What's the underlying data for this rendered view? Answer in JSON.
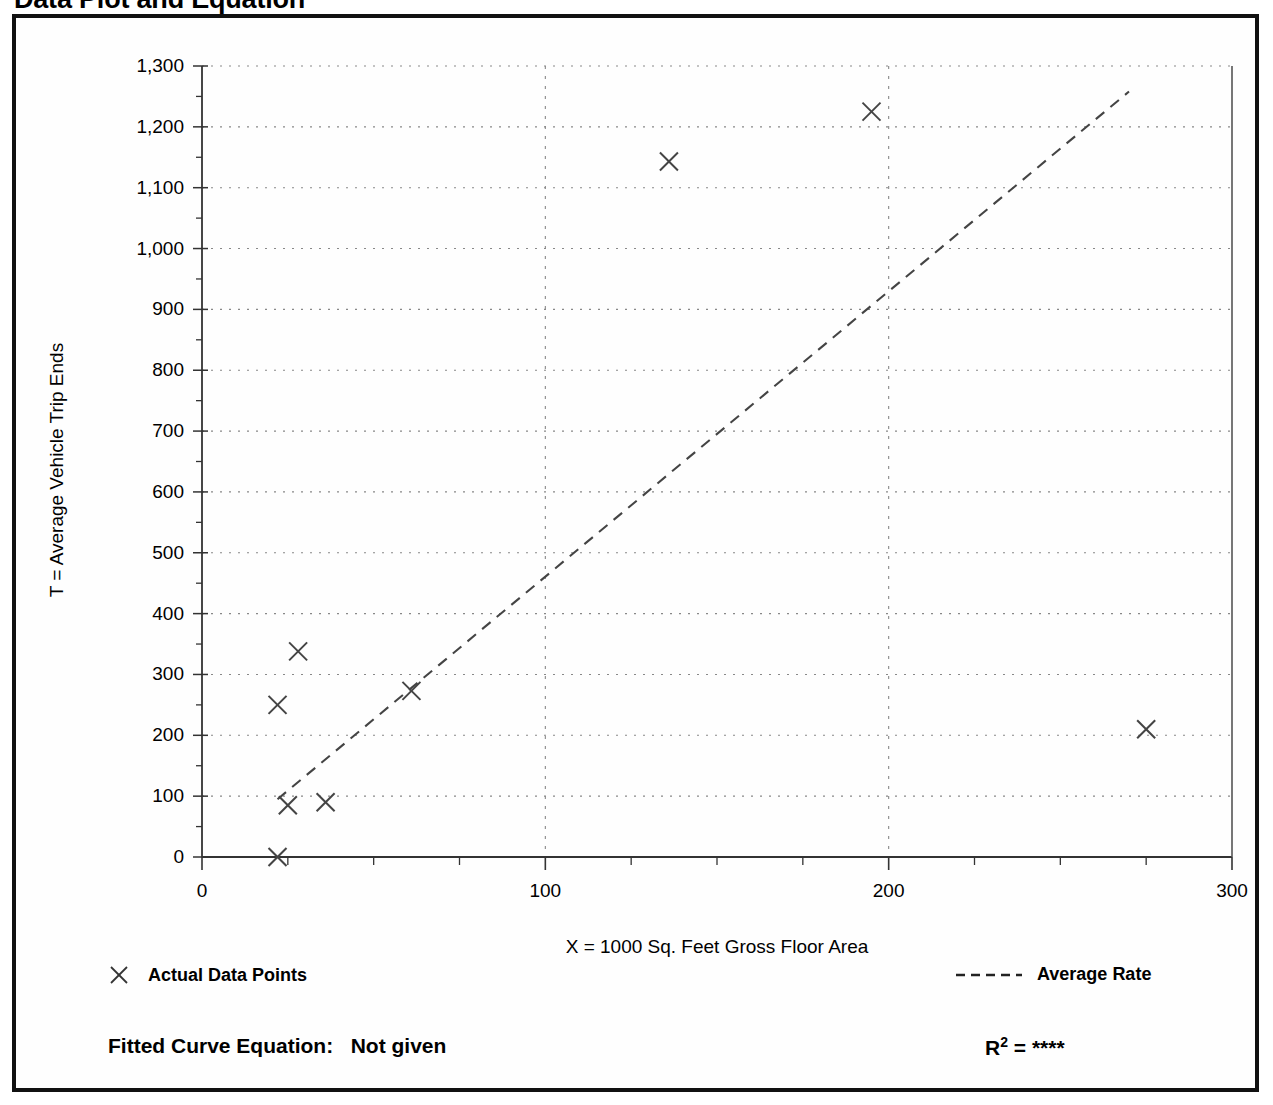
{
  "page": {
    "title": "Data Plot and Equation"
  },
  "chart_data": {
    "type": "scatter",
    "title": "Data Plot and Equation",
    "xlabel": "X = 1000 Sq. Feet Gross Floor Area",
    "ylabel": "T = Average Vehicle Trip Ends",
    "xlim": [
      0,
      300
    ],
    "ylim": [
      0,
      1300
    ],
    "x_ticks": [
      0,
      100,
      200,
      300
    ],
    "x_tick_labels": [
      "0",
      "100",
      "200",
      "300"
    ],
    "x_minor_tick_step": 25,
    "y_ticks": [
      0,
      100,
      200,
      300,
      400,
      500,
      600,
      700,
      800,
      900,
      1000,
      1100,
      1200,
      1300
    ],
    "y_tick_labels": [
      "0",
      "100",
      "200",
      "300",
      "400",
      "500",
      "600",
      "700",
      "800",
      "900",
      "1,000",
      "1,100",
      "1,200",
      "1,300"
    ],
    "grid": {
      "horizontal": true,
      "vertical": true,
      "vertical_at": [
        100,
        200
      ],
      "style": "dotted",
      "color": "#888888"
    },
    "series": [
      {
        "name": "Actual Data Points",
        "type": "scatter",
        "marker": "x",
        "color": "#444444",
        "points": [
          {
            "x": 22,
            "y": 0
          },
          {
            "x": 22,
            "y": 250
          },
          {
            "x": 25,
            "y": 85
          },
          {
            "x": 28,
            "y": 338
          },
          {
            "x": 36,
            "y": 90
          },
          {
            "x": 61,
            "y": 273
          },
          {
            "x": 136,
            "y": 1143
          },
          {
            "x": 195,
            "y": 1225
          },
          {
            "x": 275,
            "y": 210
          }
        ]
      },
      {
        "name": "Average Rate",
        "type": "line",
        "style": "dashed",
        "color": "#444444",
        "points": [
          {
            "x": 22,
            "y": 95
          },
          {
            "x": 270,
            "y": 1258
          }
        ]
      }
    ]
  },
  "legend": {
    "position": "below-axis",
    "entries": [
      {
        "label": "Actual Data Points",
        "marker": "x-marker-icon"
      },
      {
        "label": "Average Rate",
        "marker": "dashed-line-icon"
      }
    ]
  },
  "footer": {
    "fitted_curve_label": "Fitted Curve Equation:",
    "fitted_curve_value": "Not given",
    "r_squared_label": "R",
    "r_squared_exponent": "2",
    "r_squared_equals": "=",
    "r_squared_value": "****"
  },
  "colors": {
    "frame": "#111111",
    "axis": "#333333",
    "grid": "#888888",
    "marker": "#444444",
    "background": "#ffffff"
  }
}
